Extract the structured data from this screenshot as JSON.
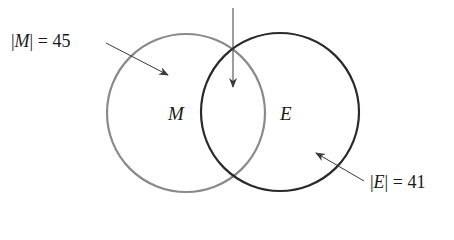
{
  "diagram": {
    "type": "venn",
    "sets": [
      {
        "id": "M",
        "label": "M",
        "cardinality_label": "|M| = 45",
        "bar": "|",
        "name": "M",
        "eq": "=",
        "value": "45",
        "stroke": "#8a8a8a"
      },
      {
        "id": "E",
        "label": "E",
        "cardinality_label": "|E| = 41",
        "bar": "|",
        "name": "E",
        "eq": "=",
        "value": "41",
        "stroke": "#2a2a2a"
      }
    ],
    "intersection_arrow": {
      "label": ""
    },
    "colors": {
      "background": "#ffffff",
      "text": "#1a1a1a",
      "arrow": "#3a3a3a"
    }
  }
}
